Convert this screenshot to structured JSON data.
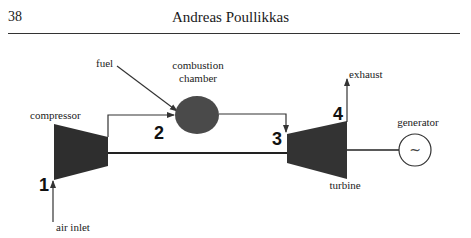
{
  "header": {
    "page_number": "38",
    "running_title": "Andreas Poullikkas"
  },
  "diagram": {
    "components": {
      "compressor": "compressor",
      "combustion_chamber_line1": "combustion",
      "combustion_chamber_line2": "chamber",
      "turbine": "turbine",
      "generator": "generator",
      "generator_symbol": "~"
    },
    "flows": {
      "fuel": "fuel",
      "air_inlet": "air inlet",
      "exhaust": "exhaust"
    },
    "state_points": [
      "1",
      "2",
      "3",
      "4"
    ],
    "colors": {
      "component_fill": "#3a3a3a",
      "line": "#333333"
    }
  }
}
